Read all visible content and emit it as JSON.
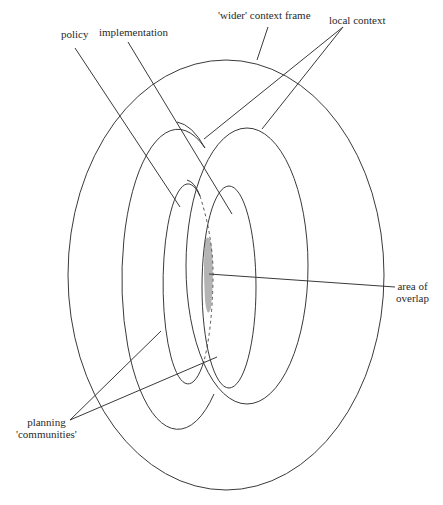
{
  "diagram": {
    "type": "nested-ellipses",
    "labels": {
      "wider_context": "'wider' context frame",
      "local_context": "local context",
      "policy": "policy",
      "implementation": "implementation",
      "area_of_overlap_line1": "area of",
      "area_of_overlap_line2": "overlap",
      "planning_line1": "planning",
      "planning_line2": "'communities'"
    },
    "colors": {
      "stroke": "#3a3a3a",
      "overlap_fill": "#b4b4b4",
      "background": "#ffffff"
    },
    "shapes": [
      {
        "name": "wider-context-frame",
        "cx": 226,
        "cy": 275,
        "rx": 158,
        "ry": 215
      },
      {
        "name": "planning-community-left",
        "cx": 177,
        "cy": 272,
        "rx": 56,
        "ry": 150
      },
      {
        "name": "planning-community-right",
        "cx": 247,
        "cy": 266,
        "rx": 61,
        "ry": 138
      },
      {
        "name": "policy-ellipse",
        "cx": 187,
        "cy": 280,
        "rx": 25,
        "ry": 100
      },
      {
        "name": "implementation-ellipse",
        "cx": 229,
        "cy": 287,
        "rx": 27,
        "ry": 101
      }
    ]
  }
}
